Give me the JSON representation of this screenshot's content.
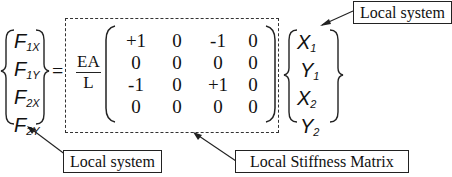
{
  "left_vector": {
    "label": "Force vector (local)",
    "entries": [
      {
        "base": "F",
        "sub": "1X"
      },
      {
        "base": "F",
        "sub": "1Y"
      },
      {
        "base": "F",
        "sub": "2X"
      },
      {
        "base": "F",
        "sub": "2Y"
      }
    ]
  },
  "equals": "=",
  "coefficient": {
    "numerator": "EA",
    "denominator": "L"
  },
  "matrix": {
    "rows": [
      [
        "+1",
        "0",
        "-1",
        "0"
      ],
      [
        "0",
        "0",
        "0",
        "0"
      ],
      [
        "-1",
        "0",
        "+1",
        "0"
      ],
      [
        "0",
        "0",
        "0",
        "0"
      ]
    ]
  },
  "right_vector": {
    "entries": [
      {
        "base": "X",
        "sub": "1"
      },
      {
        "base": "Y",
        "sub": "1"
      },
      {
        "base": "X",
        "sub": "2"
      },
      {
        "base": "Y",
        "sub": "2"
      }
    ]
  },
  "callouts": {
    "top_right": "Local system",
    "bottom_left": "Local system",
    "bottom_right": "Local Stiffness Matrix"
  }
}
